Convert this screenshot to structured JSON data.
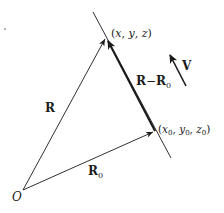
{
  "diagram": {
    "colors": {
      "ink": "#1a1a1a",
      "background": "#ffffff"
    },
    "points": {
      "origin": {
        "label": "O",
        "x": 23,
        "y": 190
      },
      "p": {
        "label": "(x, y, z)",
        "x": 106,
        "y": 37
      },
      "p0": {
        "label_x": "x",
        "label_y": "y",
        "label_z": "z",
        "sub": "0",
        "x": 155,
        "y": 131
      }
    },
    "line": {
      "x1": 93,
      "y1": 12,
      "x2": 171,
      "y2": 158
    },
    "vectors": [
      {
        "name": "R",
        "label": "R",
        "from": "origin",
        "to": "p"
      },
      {
        "name": "R0",
        "label": "R",
        "sub": "0",
        "from": "origin",
        "to": "p0"
      },
      {
        "name": "R-R0",
        "label_a": "R",
        "minus": "−",
        "label_b": "R",
        "sub": "0",
        "from": "p0",
        "to": "p",
        "heavy": true
      },
      {
        "name": "V",
        "label": "V",
        "x1": 186,
        "y1": 86,
        "x2": 169,
        "y2": 53
      }
    ]
  }
}
